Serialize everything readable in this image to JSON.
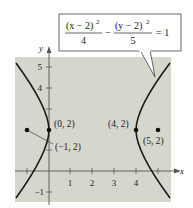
{
  "figure": {
    "type": "hyperbola-graph",
    "equation": {
      "term1_num": "(x − 2)",
      "term1_exp": "2",
      "term1_den": "4",
      "operator": "−",
      "term2_num": "(y − 2)",
      "term2_exp": "2",
      "term2_den": "5",
      "rhs": "= 1"
    },
    "axes": {
      "x_label": "x",
      "y_label": "y",
      "x_ticks": [
        "1",
        "2",
        "3",
        "4"
      ],
      "y_ticks": [
        "5",
        "4",
        "−1"
      ]
    },
    "points": [
      {
        "label": "(0, 2)",
        "x": 0,
        "y": 2,
        "role": "vertex"
      },
      {
        "label": "(4, 2)",
        "x": 4,
        "y": 2,
        "role": "vertex"
      },
      {
        "label": "(−1, 2)",
        "x": -1,
        "y": 2,
        "role": "focus"
      },
      {
        "label": "(5, 2)",
        "x": 5,
        "y": 2,
        "role": "focus"
      }
    ],
    "colors": {
      "plot_background": "#d6d6cd",
      "curve": "#1a1a1a",
      "axis": "#555555"
    }
  }
}
